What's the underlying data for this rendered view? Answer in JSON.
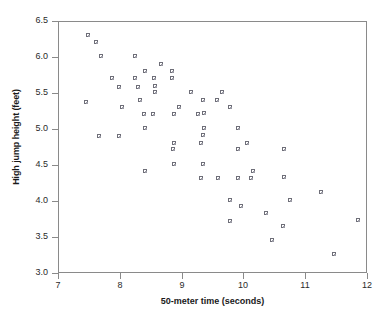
{
  "chart_data": {
    "type": "scatter",
    "title": "",
    "xlabel": "50-meter time (seconds)",
    "ylabel": "High jump height (feet)",
    "xlim": [
      7,
      12
    ],
    "ylim": [
      3.0,
      6.5
    ],
    "xticks": [
      "7",
      "8",
      "9",
      "10",
      "11",
      "12"
    ],
    "xtick_values": [
      7,
      8,
      9,
      10,
      11,
      12
    ],
    "yticks": [
      "3.0",
      "3.5",
      "4.0",
      "4.5",
      "5.0",
      "5.5",
      "6.0",
      "6.5"
    ],
    "ytick_values": [
      3.0,
      3.5,
      4.0,
      4.5,
      5.0,
      5.5,
      6.0,
      6.5
    ],
    "grid": false,
    "legend": null,
    "marker": "open-square",
    "marker_color": "#6e6e78",
    "points": [
      {
        "x": 7.48,
        "y": 6.3
      },
      {
        "x": 7.61,
        "y": 6.21
      },
      {
        "x": 7.7,
        "y": 6.01
      },
      {
        "x": 7.46,
        "y": 5.38
      },
      {
        "x": 7.88,
        "y": 5.71
      },
      {
        "x": 7.99,
        "y": 5.59
      },
      {
        "x": 8.04,
        "y": 5.3
      },
      {
        "x": 7.67,
        "y": 4.9
      },
      {
        "x": 7.99,
        "y": 4.9
      },
      {
        "x": 8.25,
        "y": 6.01
      },
      {
        "x": 8.24,
        "y": 5.71
      },
      {
        "x": 8.3,
        "y": 5.59
      },
      {
        "x": 8.33,
        "y": 5.4
      },
      {
        "x": 8.39,
        "y": 5.21
      },
      {
        "x": 8.53,
        "y": 5.21
      },
      {
        "x": 8.41,
        "y": 5.02
      },
      {
        "x": 8.4,
        "y": 4.42
      },
      {
        "x": 8.41,
        "y": 5.81
      },
      {
        "x": 8.55,
        "y": 5.71
      },
      {
        "x": 8.57,
        "y": 5.6
      },
      {
        "x": 8.57,
        "y": 5.51
      },
      {
        "x": 8.67,
        "y": 5.9
      },
      {
        "x": 8.85,
        "y": 5.81
      },
      {
        "x": 8.84,
        "y": 5.71
      },
      {
        "x": 8.87,
        "y": 5.21
      },
      {
        "x": 8.96,
        "y": 5.31
      },
      {
        "x": 8.87,
        "y": 4.8
      },
      {
        "x": 8.86,
        "y": 4.72
      },
      {
        "x": 8.88,
        "y": 4.51
      },
      {
        "x": 9.16,
        "y": 5.51
      },
      {
        "x": 9.26,
        "y": 5.21
      },
      {
        "x": 9.36,
        "y": 5.22
      },
      {
        "x": 9.35,
        "y": 5.4
      },
      {
        "x": 9.36,
        "y": 5.02
      },
      {
        "x": 9.34,
        "y": 4.91
      },
      {
        "x": 9.31,
        "y": 4.8
      },
      {
        "x": 9.35,
        "y": 4.51
      },
      {
        "x": 9.32,
        "y": 4.32
      },
      {
        "x": 9.58,
        "y": 5.4
      },
      {
        "x": 9.66,
        "y": 5.51
      },
      {
        "x": 9.78,
        "y": 5.31
      },
      {
        "x": 9.59,
        "y": 4.32
      },
      {
        "x": 9.79,
        "y": 4.02
      },
      {
        "x": 9.78,
        "y": 3.72
      },
      {
        "x": 9.92,
        "y": 5.02
      },
      {
        "x": 9.92,
        "y": 4.72
      },
      {
        "x": 10.06,
        "y": 4.81
      },
      {
        "x": 9.91,
        "y": 4.32
      },
      {
        "x": 9.96,
        "y": 3.93
      },
      {
        "x": 10.16,
        "y": 4.42
      },
      {
        "x": 10.13,
        "y": 4.32
      },
      {
        "x": 10.37,
        "y": 3.83
      },
      {
        "x": 10.47,
        "y": 3.46
      },
      {
        "x": 10.66,
        "y": 4.72
      },
      {
        "x": 10.65,
        "y": 4.33
      },
      {
        "x": 10.75,
        "y": 4.02
      },
      {
        "x": 10.64,
        "y": 3.65
      },
      {
        "x": 11.25,
        "y": 4.13
      },
      {
        "x": 11.46,
        "y": 3.26
      },
      {
        "x": 11.86,
        "y": 3.74
      }
    ]
  }
}
